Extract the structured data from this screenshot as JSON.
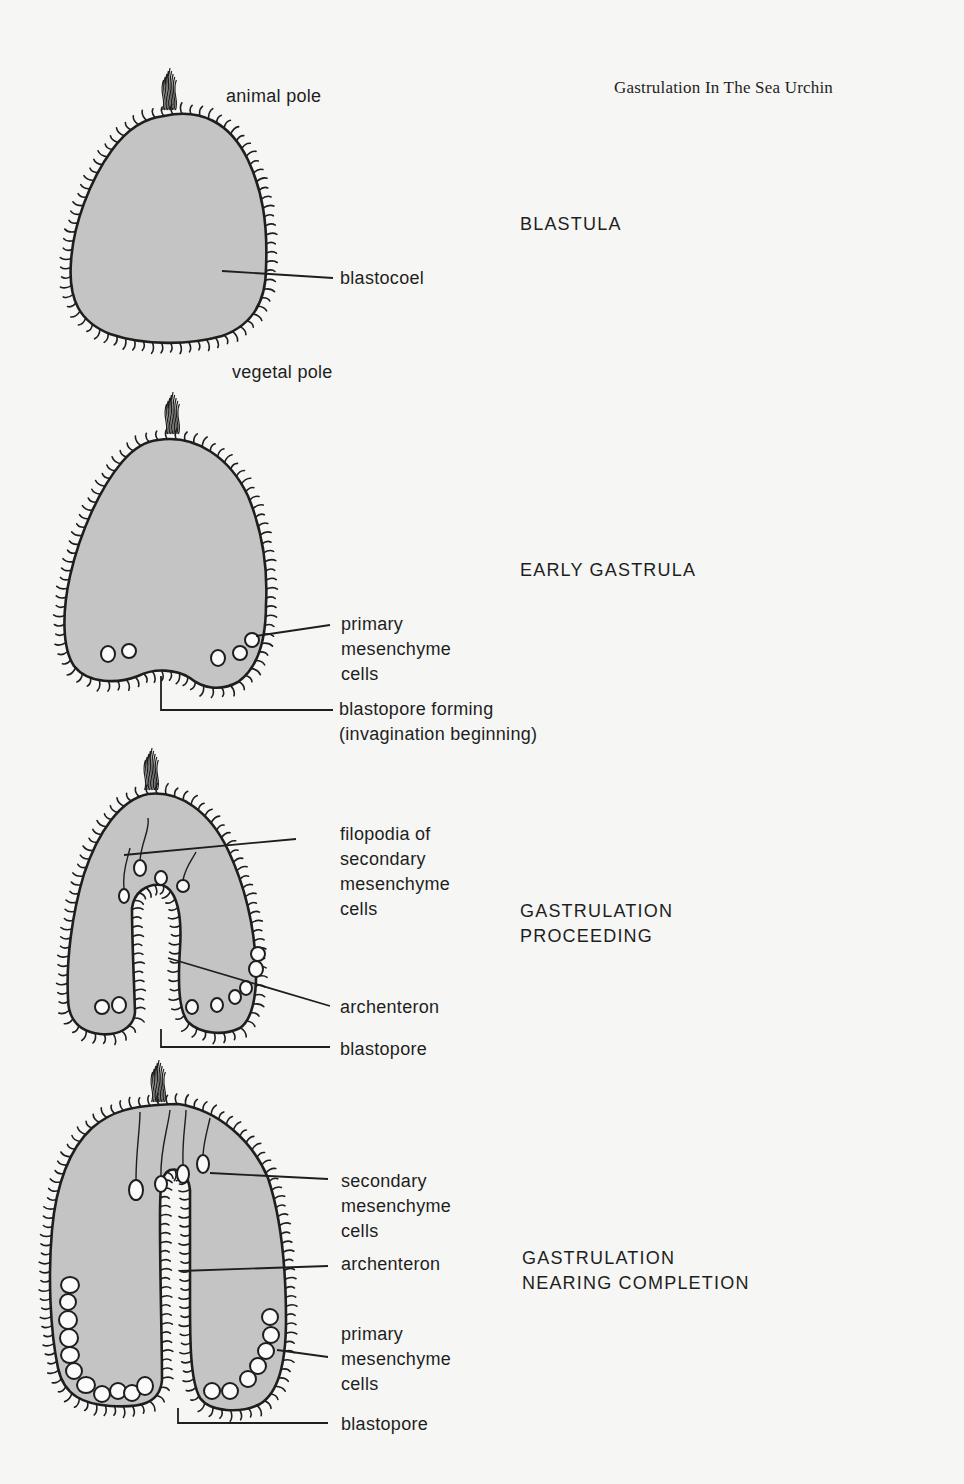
{
  "page": {
    "title": "Gastrulation In The Sea Urchin",
    "title_pos": [
      614,
      78
    ],
    "colors": {
      "background": "#f6f6f4",
      "cytoplasm_fill": "#c4c4c4",
      "ink": "#1e1e1e"
    }
  },
  "stages": [
    {
      "id": "blastula",
      "title": "BLASTULA",
      "title_pos": [
        520,
        212
      ],
      "labels": [
        {
          "name": "animal-pole-label",
          "text": "animal pole",
          "pos": [
            226,
            84
          ]
        },
        {
          "name": "blastocoel-label",
          "text": "blastocoel",
          "pos": [
            340,
            266
          ],
          "leader": [
            [
              222,
              271
            ],
            [
              333,
              278
            ]
          ]
        },
        {
          "name": "vegetal-pole-label",
          "text": "vegetal pole",
          "pos": [
            232,
            360
          ]
        }
      ]
    },
    {
      "id": "early-gastrula",
      "title": "EARLY GASTRULA",
      "title_pos": [
        520,
        558
      ],
      "labels": [
        {
          "name": "primary-mesenchyme-label",
          "text": "primary\nmesenchyme\ncells",
          "pos": [
            341,
            612
          ],
          "leader": [
            [
              256,
              636
            ],
            [
              330,
              625
            ]
          ]
        },
        {
          "name": "blastopore-forming-label",
          "text": "blastopore forming\n(invagination beginning)",
          "pos": [
            339,
            697
          ],
          "leader": [
            [
              161,
              676
            ],
            [
              161,
              710
            ],
            [
              333,
              710
            ]
          ]
        }
      ]
    },
    {
      "id": "gastrulation-proceeding",
      "title": "GASTRULATION\nPROCEEDING",
      "title_pos": [
        520,
        899
      ],
      "labels": [
        {
          "name": "filopodia-label",
          "text": "filopodia of\nsecondary\nmesenchyme\ncells",
          "pos": [
            340,
            822
          ],
          "leader": [
            [
              124,
              855
            ],
            [
              296,
              839
            ]
          ]
        },
        {
          "name": "archenteron-label-1",
          "text": "archenteron",
          "pos": [
            340,
            995
          ],
          "leader": [
            [
              168,
              958
            ],
            [
              330,
              1006
            ]
          ]
        },
        {
          "name": "blastopore-label-1",
          "text": "blastopore",
          "pos": [
            340,
            1037
          ],
          "leader": [
            [
              161,
              1029
            ],
            [
              161,
              1047
            ],
            [
              330,
              1047
            ]
          ]
        }
      ]
    },
    {
      "id": "gastrulation-nearing-completion",
      "title": "GASTRULATION\nNEARING COMPLETION",
      "title_pos": [
        522,
        1246
      ],
      "labels": [
        {
          "name": "secondary-mesenchyme-label",
          "text": "secondary\nmesenchyme\ncells",
          "pos": [
            341,
            1169
          ],
          "leader": [
            [
              210,
              1173
            ],
            [
              328,
              1179
            ]
          ]
        },
        {
          "name": "archenteron-label-2",
          "text": "archenteron",
          "pos": [
            341,
            1252
          ],
          "leader": [
            [
              180,
              1271
            ],
            [
              328,
              1266
            ]
          ]
        },
        {
          "name": "primary-mesenchyme-label-2",
          "text": "primary\nmesenchyme\ncells",
          "pos": [
            341,
            1322
          ],
          "leader": [
            [
              277,
              1350
            ],
            [
              328,
              1357
            ]
          ]
        },
        {
          "name": "blastopore-label-2",
          "text": "blastopore",
          "pos": [
            341,
            1412
          ],
          "leader": [
            [
              178,
              1408
            ],
            [
              178,
              1423
            ],
            [
              328,
              1423
            ]
          ]
        }
      ]
    }
  ],
  "figures": {
    "blastula": {
      "outline": "M164,116 C200,108 230,122 248,160 C262,190 268,222 266,268 C266,304 250,326 222,336 C190,345 145,346 110,334 C80,322 68,300 71,262 C73,225 90,180 112,150 C128,128 145,118 164,116 Z",
      "tuft": [
        169,
        110
      ]
    },
    "early_gastrula": {
      "outline": "M158,440 C196,434 230,458 248,496 C262,530 268,566 266,604 C266,640 258,668 238,682 C220,692 202,688 190,678 C176,669 154,668 138,676 C118,684 88,684 74,666 C62,648 62,612 70,576 C80,532 100,488 122,462 C134,448 146,441 158,440 Z",
      "tuft": [
        172,
        434
      ],
      "cells": [
        [
          108,
          654,
          7,
          8
        ],
        [
          129,
          651,
          7,
          7
        ],
        [
          218,
          658,
          7,
          8
        ],
        [
          240,
          653,
          7,
          7
        ],
        [
          252,
          640,
          7,
          7
        ]
      ]
    },
    "proceeding": {
      "outline": "M148,794 C180,790 210,812 228,850 C244,884 254,920 256,966 C257,996 252,1020 240,1028 C224,1036 200,1034 188,1022 C178,1010 178,980 180,948 C182,918 178,890 162,885 C146,883 134,893 132,908 C132,940 134,980 135,1012 C134,1028 118,1036 100,1034 C82,1032 68,1022 68,998 C66,960 72,914 84,874 C98,832 120,800 148,794 Z",
      "tuft": [
        151,
        790
      ],
      "cells": [
        [
          102,
          1007,
          7,
          7
        ],
        [
          119,
          1005,
          7,
          8
        ],
        [
          192,
          1007,
          6,
          7
        ],
        [
          217,
          1005,
          6,
          7
        ],
        [
          235,
          997,
          6,
          7
        ],
        [
          246,
          988,
          6,
          7
        ],
        [
          256,
          969,
          7,
          8
        ],
        [
          258,
          954,
          7,
          7
        ],
        [
          140,
          868,
          6,
          8
        ],
        [
          161,
          878,
          6,
          7
        ],
        [
          183,
          886,
          6,
          6
        ],
        [
          124,
          896,
          5,
          7
        ]
      ]
    },
    "completion": {
      "outline": "M92,1128 C110,1112 130,1105 178,1104 C218,1110 252,1140 268,1178 C282,1220 286,1270 286,1320 C286,1360 280,1392 260,1404 C240,1414 210,1412 200,1398 C190,1380 190,1340 190,1300 C190,1252 190,1210 190,1190 C188,1172 178,1168 170,1170 C160,1174 160,1190 160,1220 C160,1280 162,1340 162,1380 C160,1404 140,1408 110,1406 C84,1404 64,1396 58,1368 C50,1330 48,1276 52,1230 C56,1184 70,1148 92,1128 Z",
      "tuft": [
        158,
        1102
      ],
      "cells": [
        [
          136,
          1190,
          7,
          10
        ],
        [
          161,
          1184,
          6,
          8
        ],
        [
          183,
          1174,
          6,
          9
        ],
        [
          203,
          1164,
          6,
          9
        ],
        [
          70,
          1285,
          9,
          8
        ],
        [
          68,
          1302,
          8,
          8
        ],
        [
          68,
          1320,
          9,
          9
        ],
        [
          69,
          1338,
          9,
          9
        ],
        [
          70,
          1355,
          9,
          8
        ],
        [
          74,
          1371,
          8,
          8
        ],
        [
          86,
          1385,
          9,
          8
        ],
        [
          102,
          1394,
          8,
          8
        ],
        [
          118,
          1391,
          8,
          8
        ],
        [
          132,
          1393,
          8,
          8
        ],
        [
          145,
          1386,
          8,
          9
        ],
        [
          270,
          1317,
          8,
          8
        ],
        [
          271,
          1335,
          8,
          8
        ],
        [
          266,
          1351,
          8,
          8
        ],
        [
          258,
          1366,
          8,
          8
        ],
        [
          248,
          1379,
          8,
          8
        ],
        [
          230,
          1391,
          8,
          8
        ],
        [
          212,
          1391,
          8,
          8
        ]
      ]
    }
  }
}
